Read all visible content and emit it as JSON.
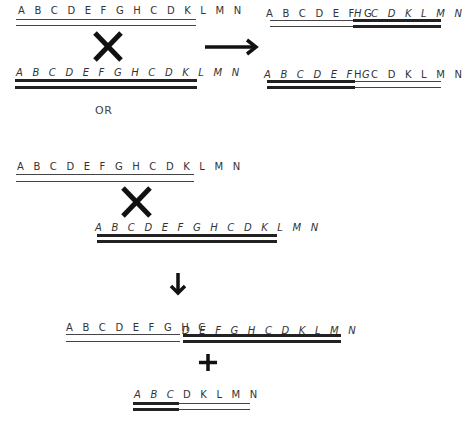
{
  "panel_top": {
    "left": {
      "upper_strand": {
        "label": "A B C D E F G H C D K L M N"
      },
      "lower_strand": {
        "label": "A B C D E F G H C D K L M N"
      }
    },
    "right": {
      "upper_strand": {
        "label_plain": "A B C D E F G",
        "label_italic": "H C D K L M N"
      },
      "lower_strand": {
        "label_italic": "A B C D E F G",
        "label_plain": "H C D K L M N"
      }
    },
    "cross_symbol": "×",
    "arrow": "right-arrow"
  },
  "separator": {
    "label": "OR"
  },
  "panel_bottom": {
    "upper_strand": {
      "label": "A B C D E F G H C D K L M N"
    },
    "lower_strand": {
      "label": "A B C D E F G H C D K L M N"
    },
    "cross_symbol": "×",
    "arrow": "down-arrow",
    "result_long": {
      "label_plain": "A B C D E F G H C",
      "label_italic": "D E F G H C D K L M N"
    },
    "plus": "+",
    "result_short": {
      "label_italic": "A B C",
      "label_plain": "D K L M N"
    }
  }
}
